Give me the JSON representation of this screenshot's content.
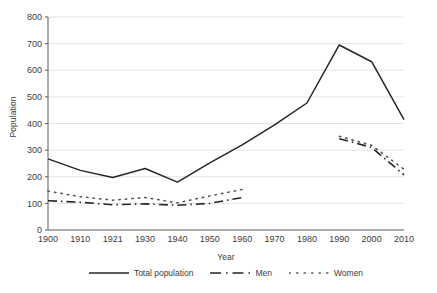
{
  "chart_data": {
    "type": "line",
    "title": "",
    "xlabel": "Year",
    "ylabel": "Population",
    "x": [
      1900,
      1910,
      1921,
      1930,
      1940,
      1950,
      1960,
      1970,
      1980,
      1990,
      2000,
      2010
    ],
    "xticklabels": [
      "1900",
      "1910",
      "1921",
      "1930",
      "1940",
      "1950",
      "1960",
      "1970",
      "1980",
      "1990",
      "2000",
      "2010"
    ],
    "yticks": [
      0,
      100,
      200,
      300,
      400,
      500,
      600,
      700,
      800
    ],
    "yticklabels": [
      "0",
      "100",
      "200",
      "300",
      "400",
      "500",
      "600",
      "700",
      "800"
    ],
    "ylim": [
      0,
      800
    ],
    "xlim": [
      1900,
      2010
    ],
    "grid": "horizontal",
    "legend_position": "bottom",
    "series": [
      {
        "name": "Total population",
        "style": "solid",
        "color": "#262626",
        "x": [
          1900,
          1910,
          1921,
          1930,
          1940,
          1950,
          1960,
          1970,
          1980,
          1990,
          2000,
          2010
        ],
        "values": [
          267,
          224,
          197,
          231,
          180,
          252,
          320,
          395,
          477,
          695,
          632,
          415
        ]
      },
      {
        "name": "Men",
        "style": "dash-dot",
        "color": "#262626",
        "x": [
          1900,
          1910,
          1921,
          1930,
          1940,
          1950,
          1960,
          1990,
          2000,
          2010
        ],
        "values": [
          110,
          104,
          95,
          98,
          93,
          100,
          122,
          343,
          310,
          207
        ],
        "gap_after": 1960
      },
      {
        "name": "Women",
        "style": "dotted",
        "color": "#262626",
        "x": [
          1900,
          1910,
          1921,
          1930,
          1940,
          1950,
          1960,
          1990,
          2000,
          2010
        ],
        "values": [
          146,
          125,
          112,
          122,
          102,
          128,
          152,
          352,
          318,
          228
        ],
        "gap_after": 1960
      }
    ]
  },
  "legend": {
    "items": [
      {
        "label": "Total population",
        "style": "solid"
      },
      {
        "label": "Men",
        "style": "dash-dot"
      },
      {
        "label": "Women",
        "style": "dotted"
      }
    ]
  }
}
